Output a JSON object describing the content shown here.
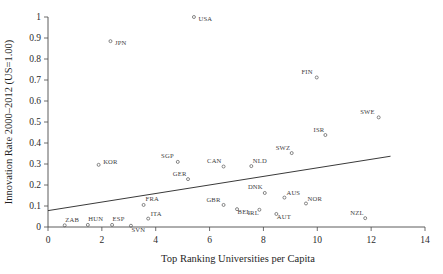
{
  "chart_data": {
    "type": "scatter",
    "title": "",
    "xlabel": "Top Ranking Universities per Capita",
    "ylabel": "Innovation Rate 2000–2012 (US=1.00)",
    "xlim": [
      0,
      14
    ],
    "ylim": [
      0,
      1
    ],
    "xticks": [
      0,
      2,
      4,
      6,
      8,
      10,
      12,
      14
    ],
    "yticks": [
      0,
      0.1,
      0.2,
      0.3,
      0.4,
      0.5,
      0.6,
      0.7,
      0.8,
      0.9,
      1
    ],
    "xticklabels": [
      "0",
      "2",
      "4",
      "6",
      "8",
      "10",
      "12",
      "14"
    ],
    "yticklabels": [
      "0",
      "0.1",
      "0.2",
      "0.3",
      "0.4",
      "0.5",
      "0.6",
      "0.7",
      "0.8",
      "0.9",
      "1"
    ],
    "grid": false,
    "legend": "none",
    "marker_style": "open-circle",
    "point_color": "#555555",
    "line_color": "#3a3a3a",
    "points": [
      {
        "label": "USA",
        "x": 5.42,
        "y": 1.0,
        "label_dx": 4.5,
        "label_dy": 3.5
      },
      {
        "label": "JPN",
        "x": 2.32,
        "y": 0.885,
        "label_dx": 4.5,
        "label_dy": 4.0
      },
      {
        "label": "FIN",
        "x": 9.98,
        "y": 0.712,
        "label_dx": -4.0,
        "label_dy": -3.5
      },
      {
        "label": "SWE",
        "x": 12.28,
        "y": 0.522,
        "label_dx": -4.0,
        "label_dy": -3.5
      },
      {
        "label": "ISR",
        "x": 10.3,
        "y": 0.438,
        "label_dx": -1.0,
        "label_dy": -3.5
      },
      {
        "label": "SWZ",
        "x": 9.05,
        "y": 0.352,
        "label_dx": -1.5,
        "label_dy": -3.5
      },
      {
        "label": "SGP",
        "x": 4.82,
        "y": 0.31,
        "label_dx": -4.0,
        "label_dy": -3.5
      },
      {
        "label": "KOR",
        "x": 1.88,
        "y": 0.296,
        "label_dx": 4.5,
        "label_dy": -1.0
      },
      {
        "label": "CAN",
        "x": 6.52,
        "y": 0.288,
        "label_dx": -2.0,
        "label_dy": -3.5
      },
      {
        "label": "NLD",
        "x": 7.55,
        "y": 0.29,
        "label_dx": 1.5,
        "label_dy": -3.5
      },
      {
        "label": "GER",
        "x": 5.2,
        "y": 0.228,
        "label_dx": -1.5,
        "label_dy": -3.5
      },
      {
        "label": "DNK",
        "x": 8.05,
        "y": 0.162,
        "label_dx": -2.0,
        "label_dy": -3.5
      },
      {
        "label": "AUS",
        "x": 8.78,
        "y": 0.14,
        "label_dx": 2.0,
        "label_dy": -3.0
      },
      {
        "label": "NOR",
        "x": 9.58,
        "y": 0.112,
        "label_dx": 1.5,
        "label_dy": -2.5
      },
      {
        "label": "GBR",
        "x": 6.52,
        "y": 0.105,
        "label_dx": -3.0,
        "label_dy": -3.0
      },
      {
        "label": "BEL",
        "x": 7.02,
        "y": 0.085,
        "label_dx": 0.5,
        "label_dy": 5.0
      },
      {
        "label": "IRL",
        "x": 7.85,
        "y": 0.082,
        "label_dx": -0.5,
        "label_dy": 5.0
      },
      {
        "label": "AUT",
        "x": 8.48,
        "y": 0.062,
        "label_dx": 0.5,
        "label_dy": 5.5
      },
      {
        "label": "FRA",
        "x": 3.55,
        "y": 0.105,
        "label_dx": 2.0,
        "label_dy": -3.5
      },
      {
        "label": "ITA",
        "x": 3.72,
        "y": 0.04,
        "label_dx": 2.5,
        "label_dy": -2.5
      },
      {
        "label": "NZL",
        "x": 11.78,
        "y": 0.042,
        "label_dx": -1.5,
        "label_dy": -3.5
      },
      {
        "label": "ZAB",
        "x": 0.62,
        "y": 0.008,
        "label_dx": 0.5,
        "label_dy": -3.5
      },
      {
        "label": "HUN",
        "x": 1.48,
        "y": 0.01,
        "label_dx": 0.5,
        "label_dy": -3.5
      },
      {
        "label": "ESP",
        "x": 2.38,
        "y": 0.01,
        "label_dx": 0.5,
        "label_dy": -3.5
      },
      {
        "label": "SVN",
        "x": 3.08,
        "y": 0.006,
        "label_dx": 0.5,
        "label_dy": 6.5
      }
    ],
    "trend_line": {
      "x0": 0.0,
      "y0": 0.078,
      "x1": 12.72,
      "y1": 0.337
    }
  }
}
